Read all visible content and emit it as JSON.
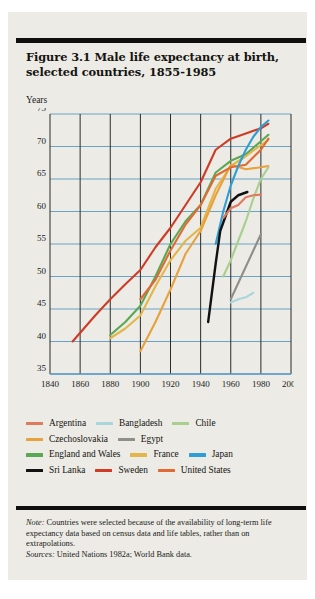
{
  "figure": {
    "title": "Figure 3.1  Male life expectancy at birth, selected countries, 1855-1985",
    "axis_unit_label": "Years"
  },
  "notes": {
    "note_label": "Note:",
    "note_text": "Countries were selected because of the availability of long-term life expectancy data based on census data and life tables, rather than on extrapolations.",
    "sources_label": "Sources:",
    "sources_text": "United Nations 1982a; World Bank data."
  },
  "colors": {
    "argentina": "#e07a5f",
    "bangladesh": "#a9d6dd",
    "chile": "#a8cf8e",
    "czechoslovakia": "#e8a13c",
    "egypt": "#8f8f8a",
    "england_and_wales": "#5aa854",
    "france": "#e3b64a",
    "japan": "#2f9ed4",
    "sri_lanka": "#111111",
    "sweden": "#cf3b24",
    "united_states": "#e06a33",
    "gridline_h": "#5b9bc4",
    "gridline_v": "#2b2b28",
    "axis": "#5b9bc4",
    "paper": "#ecebe6",
    "ink": "#15140f"
  },
  "legend": {
    "rows": [
      [
        {
          "label": "Argentina",
          "color_key": "argentina"
        },
        {
          "label": "Bangladesh",
          "color_key": "bangladesh"
        },
        {
          "label": "Chile",
          "color_key": "chile"
        }
      ],
      [
        {
          "label": "Czechoslovakia",
          "color_key": "czechoslovakia"
        },
        {
          "label": "Egypt",
          "color_key": "egypt"
        }
      ],
      [
        {
          "label": "England and Wales",
          "color_key": "england_and_wales"
        },
        {
          "label": "France",
          "color_key": "france"
        },
        {
          "label": "Japan",
          "color_key": "japan"
        }
      ],
      [
        {
          "label": "Sri Lanka",
          "color_key": "sri_lanka"
        },
        {
          "label": "Sweden",
          "color_key": "sweden"
        },
        {
          "label": "United States",
          "color_key": "united_states"
        }
      ]
    ]
  },
  "chart_data": {
    "type": "line",
    "title": "Figure 3.1  Male life expectancy at birth, selected countries, 1855-1985",
    "xlabel": "",
    "ylabel": "Years",
    "xlim": [
      1840,
      2000
    ],
    "ylim": [
      35,
      75
    ],
    "xticks": [
      1840,
      1860,
      1880,
      1900,
      1920,
      1940,
      1960,
      1980,
      2000
    ],
    "yticks": [
      35,
      40,
      45,
      50,
      55,
      60,
      65,
      70,
      75
    ],
    "grid": "both",
    "legend_position": "below-plot",
    "series": [
      {
        "name": "Sweden",
        "color_key": "sweden",
        "x": [
          1855,
          1870,
          1880,
          1890,
          1900,
          1910,
          1920,
          1930,
          1940,
          1950,
          1960,
          1970,
          1980,
          1985
        ],
        "y": [
          40.0,
          44.0,
          46.5,
          48.8,
          51.0,
          54.5,
          57.5,
          61.0,
          64.5,
          69.5,
          71.2,
          72.0,
          72.8,
          73.5
        ]
      },
      {
        "name": "England and Wales",
        "color_key": "england_and_wales",
        "x": [
          1880,
          1890,
          1900,
          1910,
          1920,
          1930,
          1940,
          1950,
          1960,
          1970,
          1980,
          1985
        ],
        "y": [
          41.0,
          43.0,
          45.5,
          50.0,
          55.0,
          58.5,
          61.0,
          66.0,
          67.8,
          68.8,
          70.8,
          71.8
        ]
      },
      {
        "name": "France",
        "color_key": "france",
        "x": [
          1880,
          1890,
          1900,
          1910,
          1920,
          1930,
          1940,
          1950,
          1960,
          1970,
          1980,
          1985
        ],
        "y": [
          40.5,
          42.0,
          44.0,
          48.5,
          52.5,
          55.5,
          57.5,
          63.5,
          67.0,
          68.5,
          70.2,
          71.0
        ]
      },
      {
        "name": "Czechoslovakia",
        "color_key": "czechoslovakia",
        "x": [
          1900,
          1910,
          1920,
          1930,
          1940,
          1950,
          1960,
          1970,
          1980,
          1985
        ],
        "y": [
          38.5,
          43.0,
          48.0,
          53.5,
          57.0,
          62.5,
          67.2,
          66.5,
          66.8,
          67.0
        ]
      },
      {
        "name": "United States",
        "color_key": "united_states",
        "x": [
          1900,
          1910,
          1920,
          1930,
          1940,
          1950,
          1960,
          1970,
          1980,
          1985
        ],
        "y": [
          46.5,
          49.5,
          54.0,
          58.0,
          61.0,
          65.5,
          66.8,
          67.2,
          69.5,
          71.2
        ]
      },
      {
        "name": "Japan",
        "color_key": "japan",
        "x": [
          1950,
          1955,
          1960,
          1965,
          1970,
          1975,
          1980,
          1985
        ],
        "y": [
          55.0,
          60.0,
          64.0,
          67.0,
          69.5,
          71.5,
          73.0,
          74.0
        ]
      },
      {
        "name": "Sri Lanka",
        "color_key": "sri_lanka",
        "x": [
          1945,
          1950,
          1953,
          1960,
          1965,
          1971
        ],
        "y": [
          43.0,
          52.0,
          57.0,
          61.5,
          62.5,
          63.0
        ]
      },
      {
        "name": "Chile",
        "color_key": "chile",
        "x": [
          1955,
          1960,
          1965,
          1970,
          1975,
          1980,
          1985
        ],
        "y": [
          50.0,
          52.5,
          55.5,
          58.5,
          62.0,
          65.0,
          66.8
        ]
      },
      {
        "name": "Argentina",
        "color_key": "argentina",
        "x": [
          1955,
          1960,
          1965,
          1970,
          1975,
          1980
        ],
        "y": [
          59.0,
          60.5,
          61.0,
          62.2,
          62.5,
          62.6
        ]
      },
      {
        "name": "Egypt",
        "color_key": "egypt",
        "x": [
          1960,
          1965,
          1970,
          1975,
          1980
        ],
        "y": [
          46.5,
          49.0,
          51.5,
          54.0,
          56.5
        ]
      },
      {
        "name": "Bangladesh",
        "color_key": "bangladesh",
        "x": [
          1960,
          1965,
          1970,
          1975
        ],
        "y": [
          46.0,
          46.5,
          46.8,
          47.5
        ]
      }
    ]
  }
}
